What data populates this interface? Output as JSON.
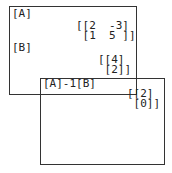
{
  "screen1": {
    "lines": [
      {
        "text": "[A]"
      },
      {
        "text": "[[2  -3]"
      },
      {
        "text": " [1  5 ]]"
      },
      {
        "text": "[B]"
      },
      {
        "text": "[[4]"
      },
      {
        "text": " [2]]"
      }
    ]
  },
  "screen2": {
    "lines": [
      {
        "text": "[A]-1[B]"
      },
      {
        "text": "[[2]"
      },
      {
        "text": " [0]]"
      }
    ]
  }
}
